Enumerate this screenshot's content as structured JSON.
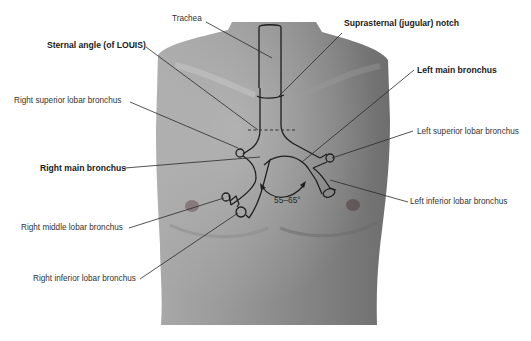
{
  "diagram": {
    "colors": {
      "background": "#ffffff",
      "skin_light": "#b4b4b4",
      "skin_dark": "#7a7a7a",
      "outline": "#1e1e1e",
      "leader": "#2a2a2a",
      "label_text": "#333333"
    },
    "labels": {
      "trachea": "Trachea",
      "suprasternal_notch": "Suprasternal (jugular) notch",
      "sternal_angle": "Sternal angle (of LOUIS)",
      "left_main_bronchus": "Left main bronchus",
      "right_superior_lobar": "Right superior lobar bronchus",
      "left_superior_lobar": "Left superior lobar bronchus",
      "right_main_bronchus": "Right main bronchus",
      "left_inferior_lobar": "Left inferior lobar bronchus",
      "right_middle_lobar": "Right middle lobar bronchus",
      "right_inferior_lobar": "Right inferior lobar bronchus",
      "carina_angle": "55–65°"
    }
  }
}
